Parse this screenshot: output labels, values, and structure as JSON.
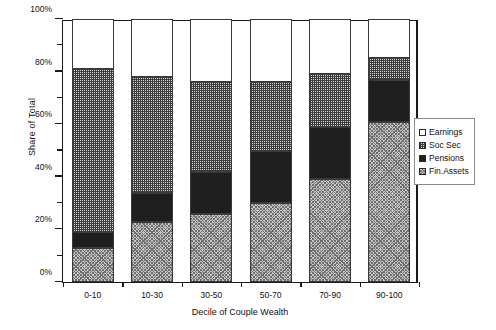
{
  "chart_data": {
    "type": "bar",
    "stacked": true,
    "title": "",
    "xlabel": "Decile of Couple Wealth",
    "ylabel": "Share of Total",
    "categories": [
      "0-10",
      "10-30",
      "30-50",
      "50-70",
      "70-90",
      "90-100"
    ],
    "ylim": [
      0,
      100
    ],
    "ytick_labels": [
      "0%",
      "20%",
      "40%",
      "60%",
      "80%",
      "100%"
    ],
    "ytick_values": [
      0,
      20,
      40,
      60,
      80,
      100
    ],
    "yminor_values": [
      10,
      30,
      50,
      70,
      90
    ],
    "grid": false,
    "legend_position": "right",
    "series": [
      {
        "name": "Fin.Assets",
        "pattern": "crosshatch",
        "values": [
          13,
          23,
          26,
          30,
          39,
          61
        ]
      },
      {
        "name": "Pensions",
        "pattern": "solid-dark",
        "values": [
          6,
          11,
          16,
          20,
          20,
          16
        ]
      },
      {
        "name": "Soc Sec",
        "pattern": "stipple",
        "values": [
          62,
          44,
          34,
          26,
          20,
          8
        ]
      },
      {
        "name": "Earnings",
        "pattern": "empty-white",
        "values": [
          19,
          22,
          24,
          24,
          21,
          15
        ]
      }
    ],
    "stack_order_bottom_to_top": [
      "Fin.Assets",
      "Pensions",
      "Soc Sec",
      "Earnings"
    ],
    "cumulative_tops": {
      "Fin.Assets": [
        13,
        23,
        26,
        30,
        39,
        61
      ],
      "Pensions": [
        19,
        34,
        42,
        50,
        59,
        77
      ],
      "Soc Sec": [
        81,
        78,
        76,
        76,
        79,
        85
      ],
      "Earnings": [
        100,
        100,
        100,
        100,
        100,
        100
      ]
    }
  },
  "legend": {
    "items": [
      {
        "label": "Earnings",
        "swatch": "empty-white"
      },
      {
        "label": "Soc Sec",
        "swatch": "stipple"
      },
      {
        "label": "Pensions",
        "swatch": "solid-dark"
      },
      {
        "label": "Fin.Assets",
        "swatch": "crosshatch"
      }
    ]
  },
  "colors": {
    "axis": "#1a1a1a",
    "pensions": "#1e1e1e",
    "socsec": "#d8d8d8",
    "finassets": "#c8c8c8",
    "earnings": "#ffffff"
  }
}
